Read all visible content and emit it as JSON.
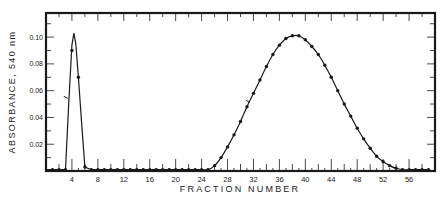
{
  "chart_data": {
    "type": "line",
    "title": "",
    "xlabel": "FRACTION NUMBER",
    "ylabel": "ABSORBANCE, 540 nm",
    "xlim": [
      0,
      60
    ],
    "ylim": [
      0,
      0.118
    ],
    "xticks_labeled": [
      4,
      8,
      12,
      16,
      20,
      24,
      28,
      32,
      36,
      40,
      44,
      48,
      52,
      56
    ],
    "yticks_labeled": [
      0.02,
      0.04,
      0.06,
      0.08,
      0.1
    ],
    "ytick_labels": [
      "0.02",
      "0.04",
      "0.06",
      "0.08",
      "0.10"
    ],
    "grid": false,
    "legend": null,
    "series": [
      {
        "name": "Peak 1",
        "points": [
          {
            "x": 1,
            "y": 0.001
          },
          {
            "x": 2,
            "y": 0.001
          },
          {
            "x": 3,
            "y": 0.001
          },
          {
            "x": 4,
            "y": 0.09
          },
          {
            "x": 5,
            "y": 0.07
          },
          {
            "x": 6,
            "y": 0.003
          },
          {
            "x": 7,
            "y": 0.001
          }
        ],
        "curve": [
          [
            0,
            0.001
          ],
          [
            3.0,
            0.001
          ],
          [
            3.5,
            0.05
          ],
          [
            4.0,
            0.094
          ],
          [
            4.3,
            0.103
          ],
          [
            4.6,
            0.095
          ],
          [
            5.0,
            0.07
          ],
          [
            5.5,
            0.035
          ],
          [
            6.0,
            0.003
          ],
          [
            7,
            0.001
          ]
        ]
      },
      {
        "name": "Peak 2",
        "points": [
          {
            "x": 8,
            "y": 0.001
          },
          {
            "x": 9,
            "y": 0.001
          },
          {
            "x": 10,
            "y": 0.001
          },
          {
            "x": 11,
            "y": 0.001
          },
          {
            "x": 12,
            "y": 0.001
          },
          {
            "x": 13,
            "y": 0.001
          },
          {
            "x": 14,
            "y": 0.001
          },
          {
            "x": 15,
            "y": 0.001
          },
          {
            "x": 16,
            "y": 0.001
          },
          {
            "x": 17,
            "y": 0.001
          },
          {
            "x": 18,
            "y": 0.001
          },
          {
            "x": 19,
            "y": 0.001
          },
          {
            "x": 20,
            "y": 0.001
          },
          {
            "x": 21,
            "y": 0.001
          },
          {
            "x": 22,
            "y": 0.001
          },
          {
            "x": 23,
            "y": 0.001
          },
          {
            "x": 24,
            "y": 0.001
          },
          {
            "x": 25,
            "y": 0.001
          },
          {
            "x": 26,
            "y": 0.004
          },
          {
            "x": 27,
            "y": 0.01
          },
          {
            "x": 28,
            "y": 0.018
          },
          {
            "x": 29,
            "y": 0.027
          },
          {
            "x": 30,
            "y": 0.037
          },
          {
            "x": 31,
            "y": 0.048
          },
          {
            "x": 32,
            "y": 0.058
          },
          {
            "x": 33,
            "y": 0.068
          },
          {
            "x": 34,
            "y": 0.078
          },
          {
            "x": 35,
            "y": 0.087
          },
          {
            "x": 36,
            "y": 0.094
          },
          {
            "x": 37,
            "y": 0.099
          },
          {
            "x": 38,
            "y": 0.101
          },
          {
            "x": 39,
            "y": 0.101
          },
          {
            "x": 40,
            "y": 0.098
          },
          {
            "x": 41,
            "y": 0.093
          },
          {
            "x": 42,
            "y": 0.087
          },
          {
            "x": 43,
            "y": 0.079
          },
          {
            "x": 44,
            "y": 0.07
          },
          {
            "x": 45,
            "y": 0.06
          },
          {
            "x": 46,
            "y": 0.05
          },
          {
            "x": 47,
            "y": 0.041
          },
          {
            "x": 48,
            "y": 0.032
          },
          {
            "x": 49,
            "y": 0.024
          },
          {
            "x": 50,
            "y": 0.017
          },
          {
            "x": 51,
            "y": 0.011
          },
          {
            "x": 52,
            "y": 0.007
          },
          {
            "x": 53,
            "y": 0.004
          },
          {
            "x": 54,
            "y": 0.002
          },
          {
            "x": 55,
            "y": 0.001
          },
          {
            "x": 56,
            "y": 0.001
          },
          {
            "x": 57,
            "y": 0.001
          },
          {
            "x": 58,
            "y": 0.001
          },
          {
            "x": 59,
            "y": 0.001
          }
        ]
      }
    ],
    "annotations": [
      {
        "type": "tick-mark",
        "x": 3.2,
        "y": 0.055
      },
      {
        "type": "tick-mark",
        "x": 31.3,
        "y": 0.052
      }
    ]
  },
  "labels": {
    "xlabel": "FRACTION NUMBER",
    "ylabel": "ABSORBANCE, 540 nm"
  }
}
